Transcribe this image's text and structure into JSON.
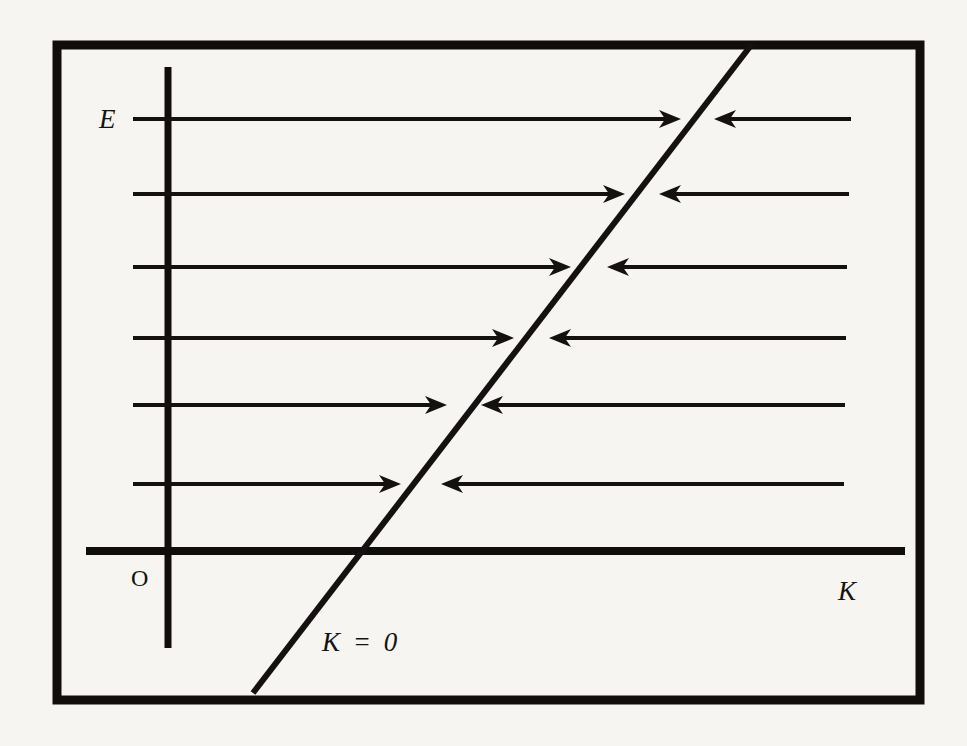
{
  "figure": {
    "kind": "phase-line-diagram",
    "background_color": "#f7f5f1",
    "ink_color": "#141110",
    "labels": {
      "y_axis": "E",
      "x_axis": "K",
      "origin": "O",
      "diagonal": "K = 0"
    }
  },
  "chart_data": {
    "type": "line",
    "title": "",
    "xlabel": "K",
    "ylabel": "E",
    "grid": false,
    "legend": false,
    "annotations": [
      {
        "text": "E",
        "role": "vertical-axis-label",
        "x": 107,
        "y": 119
      },
      {
        "text": "K",
        "role": "horizontal-axis-label",
        "x": 845,
        "y": 590
      },
      {
        "text": "O",
        "role": "origin-label",
        "x": 138,
        "y": 578
      },
      {
        "text": "K = 0",
        "role": "nullcline-label",
        "x": 325,
        "y": 642
      }
    ],
    "frame": {
      "x": 57,
      "y": 45,
      "width": 863,
      "height": 655,
      "stroke_width": 9
    },
    "axes": {
      "vertical": {
        "x": 168,
        "y_top": 67,
        "y_bottom": 648,
        "stroke_width": 7
      },
      "horizontal": {
        "y": 551,
        "x_left": 86,
        "x_right": 905,
        "stroke_width": 8
      }
    },
    "nullcline": {
      "label": "K = 0",
      "x1": 253,
      "y1": 693,
      "x2": 752,
      "y2": 44,
      "stroke_width": 6,
      "description": "rising straight line, trajectories converge onto it from both sides"
    },
    "flow_rows": [
      {
        "y": 119,
        "left_start": 133,
        "left_tip": 681,
        "right_tip": 714,
        "right_end": 851
      },
      {
        "y": 194,
        "left_start": 133,
        "left_tip": 625,
        "right_tip": 659,
        "right_end": 849
      },
      {
        "y": 267,
        "left_start": 133,
        "left_tip": 571,
        "right_tip": 607,
        "right_end": 847
      },
      {
        "y": 338,
        "left_start": 133,
        "left_tip": 514,
        "right_tip": 549,
        "right_end": 846
      },
      {
        "y": 405,
        "left_start": 133,
        "left_tip": 447,
        "right_tip": 481,
        "right_end": 845
      },
      {
        "y": 484,
        "left_start": 133,
        "left_tip": 401,
        "right_tip": 441,
        "right_end": 844
      }
    ],
    "flow_style": {
      "stroke_width": 4,
      "arrow_length": 22,
      "arrow_half_width": 9,
      "note": "each row has a rightward arrow on the left of the nullcline and a leftward arrow on the right of it"
    }
  }
}
